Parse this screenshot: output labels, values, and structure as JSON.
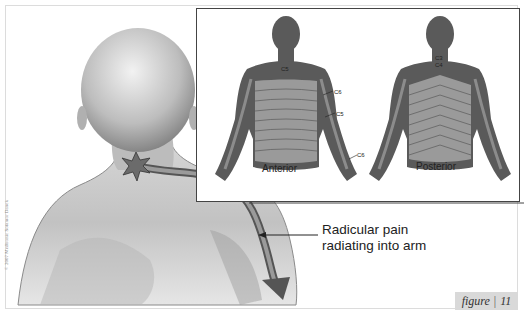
{
  "figure": {
    "tag_word": "figure",
    "tag_separator": "|",
    "tag_number": "11"
  },
  "inset": {
    "anterior_label": "Anterior",
    "posterior_label": "Posterior",
    "dermatome_labels": {
      "anterior_neck": "C5",
      "anterior_upper_arm": "C6",
      "anterior_lower_arm": "C5",
      "hand": "C6",
      "posterior_neck_top": "C3",
      "posterior_neck_bottom": "C4"
    }
  },
  "callout": {
    "line1": "Radicular pain",
    "line2": "radiating into arm"
  },
  "copyright": "© 2007 Medtronic Sofamor Danek",
  "colors": {
    "figure_dark": "#5a5a5a",
    "figure_band": "#9a9a9a",
    "skin": "#cfcfcf",
    "pain_path": "#6b6b6b",
    "tag_bg": "#d9d9d9"
  }
}
